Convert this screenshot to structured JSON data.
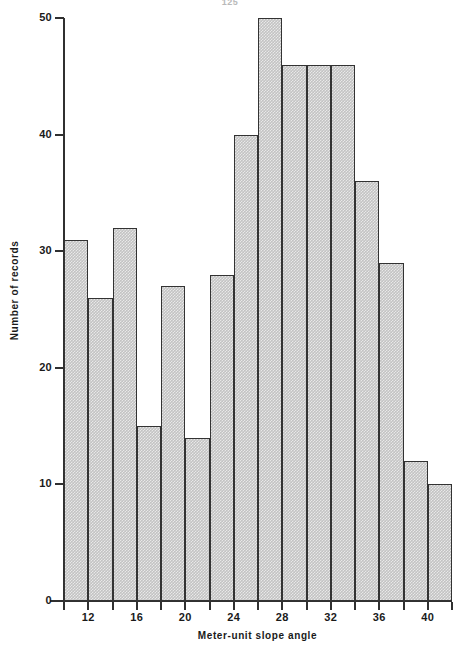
{
  "page": {
    "header_text": "125"
  },
  "chart_data": {
    "type": "bar",
    "title": "",
    "subtitle": "",
    "xlabel": "Meter-unit slope angle",
    "ylabel": "Number of records",
    "xlim": [
      10,
      42
    ],
    "ylim": [
      0,
      50
    ],
    "grid": false,
    "legend": "none",
    "bin_width": 2,
    "bin_starts": [
      10,
      12,
      14,
      16,
      18,
      20,
      22,
      24,
      26,
      28,
      30,
      32,
      34,
      36,
      38,
      40
    ],
    "categories": [
      "10-12",
      "12-14",
      "14-16",
      "16-18",
      "18-20",
      "20-22",
      "22-24",
      "24-26",
      "26-28",
      "28-30",
      "30-32",
      "32-34",
      "34-36",
      "36-38",
      "38-40",
      "40-42"
    ],
    "values": [
      31,
      26,
      32,
      15,
      27,
      14,
      28,
      40,
      50,
      46,
      46,
      46,
      36,
      29,
      12,
      10
    ],
    "x_tick_labels": [
      "12",
      "16",
      "20",
      "24",
      "28",
      "32",
      "36",
      "40"
    ],
    "x_tick_values": [
      12,
      16,
      20,
      24,
      28,
      32,
      36,
      40
    ],
    "y_tick_labels": [
      "0",
      "10",
      "20",
      "30",
      "40",
      "50"
    ],
    "y_tick_values": [
      0,
      10,
      20,
      30,
      40,
      50
    ],
    "bar_fill_color": "#c3c3c3",
    "bar_edge_color": "#333333",
    "axis_color": "#303030",
    "background_color": "#ffffff"
  }
}
